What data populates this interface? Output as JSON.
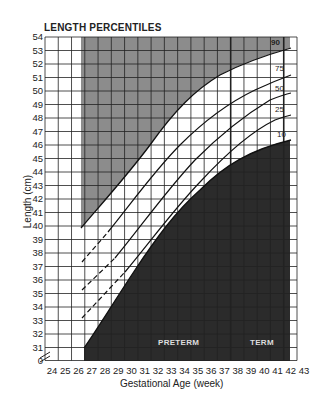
{
  "title": "LENGTH PERCENTILES",
  "chart_data": {
    "type": "line",
    "title": "LENGTH PERCENTILES",
    "xlabel": "Gestational Age (week)",
    "ylabel": "Length (cm)",
    "xlim": [
      24,
      43
    ],
    "ylim": [
      31,
      54
    ],
    "y_axis_break": "0 shown below 31 with axis break",
    "grid": true,
    "x_ticks": [
      "24",
      "25",
      "26",
      "27",
      "28",
      "29",
      "30",
      "31",
      "32",
      "33",
      "34",
      "35",
      "36",
      "37",
      "38",
      "39",
      "40",
      "41",
      "42",
      "43"
    ],
    "y_ticks": [
      "54",
      "53",
      "52",
      "51",
      "50",
      "49",
      "48",
      "47",
      "46",
      "45",
      "44",
      "43",
      "42",
      "41",
      "40",
      "39",
      "38",
      "37",
      "36",
      "35",
      "34",
      "33",
      "32",
      "31",
      "0"
    ],
    "series": [
      {
        "name": "90",
        "x": [
          26.5,
          28,
          30,
          32,
          34,
          36,
          38,
          40,
          42
        ],
        "y": [
          40.0,
          42.3,
          45.1,
          47.4,
          49.2,
          50.6,
          51.6,
          52.4,
          53.2
        ],
        "style": "solid"
      },
      {
        "name": "75",
        "x": [
          26.5,
          28,
          30,
          32,
          34,
          36,
          38,
          40,
          42
        ],
        "y": [
          37.5,
          39.6,
          42.3,
          44.8,
          46.9,
          48.5,
          49.6,
          50.5,
          51.2
        ],
        "style": "dashed until ~28 then solid"
      },
      {
        "name": "50",
        "x": [
          26.5,
          28,
          30,
          32,
          34,
          36,
          38,
          40,
          42
        ],
        "y": [
          35.5,
          37.6,
          40.3,
          43.0,
          45.3,
          47.0,
          48.3,
          49.2,
          49.9
        ],
        "style": "dashed until ~28.5 then solid"
      },
      {
        "name": "25",
        "x": [
          26.5,
          28,
          30,
          32,
          34,
          36,
          38,
          40,
          42
        ],
        "y": [
          33.5,
          35.4,
          38.2,
          41.0,
          43.5,
          45.4,
          46.8,
          47.7,
          48.3
        ],
        "style": "dashed until ~29 then solid"
      },
      {
        "name": "10",
        "x": [
          26.8,
          28,
          30,
          32,
          34,
          36,
          38,
          40,
          42
        ],
        "y": [
          31.0,
          32.6,
          35.3,
          38.4,
          41.3,
          43.6,
          45.2,
          46.0,
          46.4
        ],
        "style": "solid"
      }
    ],
    "shaded_regions": [
      {
        "name": "above 90th percentile",
        "color": "#8c8c8c",
        "x_range": [
          26.5,
          42
        ]
      },
      {
        "name": "below 10th percentile",
        "color": "#2a2a2a",
        "x_range": [
          26.8,
          42
        ]
      }
    ],
    "annotations": [
      "PRETERM",
      "TERM"
    ]
  },
  "annotations": {
    "preterm": "PRETERM",
    "term": "TERM"
  },
  "percentile_labels": {
    "p90": "90",
    "p75": "75",
    "p50": "50",
    "p25": "25",
    "p10": "10"
  }
}
